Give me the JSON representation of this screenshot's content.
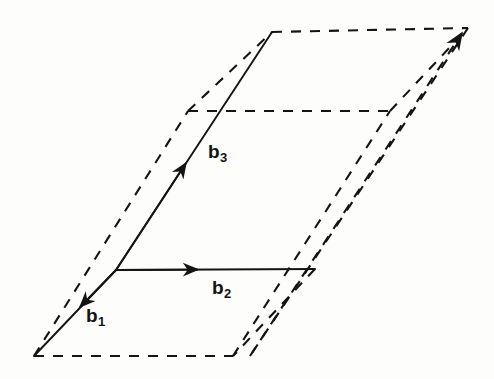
{
  "figure": {
    "type": "line-diagram",
    "background_color": "#fdfdfc",
    "stroke_color": "#141414",
    "width": 494,
    "height": 379
  },
  "labels": {
    "b1": {
      "base": "b",
      "sub": "1",
      "x": 86,
      "y": 306
    },
    "b2": {
      "base": "b",
      "sub": "2",
      "x": 212,
      "y": 278
    },
    "b3": {
      "base": "b",
      "sub": "3",
      "x": 208,
      "y": 142
    }
  },
  "geometry": {
    "origin": {
      "x": 116,
      "y": 270
    },
    "vertices": {
      "front_bottom_left": {
        "x": 34,
        "y": 356
      },
      "front_bottom_right": {
        "x": 233,
        "y": 356
      },
      "front_top_left": {
        "x": 188,
        "y": 111
      },
      "front_top_right": {
        "x": 390,
        "y": 111
      },
      "back_bottom_right": {
        "x": 250,
        "y": 356
      },
      "back_top_left": {
        "x": 272,
        "y": 32
      },
      "back_top_right": {
        "x": 468,
        "y": 28
      },
      "b2_tip": {
        "x": 315,
        "y": 269
      }
    },
    "solid_vectors": [
      {
        "name": "b1",
        "from": {
          "x": 116,
          "y": 270
        },
        "to": {
          "x": 34,
          "y": 356
        },
        "arrow_at": {
          "x": 78,
          "y": 313
        }
      },
      {
        "name": "b2",
        "from": {
          "x": 116,
          "y": 270
        },
        "to": {
          "x": 315,
          "y": 269
        },
        "arrow_at": {
          "x": 200,
          "y": 269
        }
      },
      {
        "name": "b3",
        "from": {
          "x": 116,
          "y": 270
        },
        "to": {
          "x": 272,
          "y": 32
        },
        "arrow_at": {
          "x": 185,
          "y": 155
        }
      }
    ],
    "dashed_arrow_tip": {
      "x": 468,
      "y": 28
    },
    "dash_pattern": "10 9",
    "stroke_width_solid": 1.9,
    "stroke_width_dashed": 2.1
  }
}
